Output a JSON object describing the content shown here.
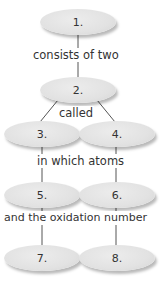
{
  "nodes": [
    {
      "id": 1,
      "label": "1."
    },
    {
      "id": 2,
      "label": "2."
    },
    {
      "id": 3,
      "label": "3."
    },
    {
      "id": 4,
      "label": "4."
    },
    {
      "id": 5,
      "label": "5."
    },
    {
      "id": 6,
      "label": "6."
    },
    {
      "id": 7,
      "label": "7."
    },
    {
      "id": 8,
      "label": "8."
    }
  ],
  "links": {
    "l1": "consists of two",
    "l2": "called",
    "l3": "in which atoms",
    "l4": "and the oxidation number"
  },
  "colors": {
    "node_fill": "#e4e4e4",
    "line": "#555555",
    "text": "#333333"
  }
}
